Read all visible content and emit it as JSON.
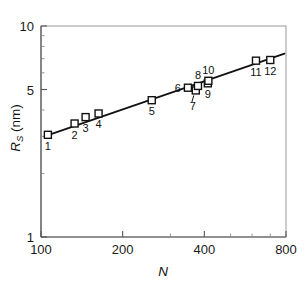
{
  "chart_data": {
    "type": "scatter",
    "title": "",
    "xlabel": "N",
    "ylabel": "R_S (nm)",
    "ylabel_main": "R",
    "ylabel_sub": "S",
    "ylabel_unit": " (nm)",
    "xscale": "log",
    "yscale": "log",
    "xlim": [
      100,
      800
    ],
    "ylim": [
      1,
      10
    ],
    "grid": false,
    "legend": "none",
    "xticks": [
      100,
      200,
      400,
      800
    ],
    "xtick_labels": [
      "100",
      "200",
      "400",
      "800"
    ],
    "xticks_minor": [
      300,
      500,
      600,
      700
    ],
    "yticks": [
      1,
      5,
      10
    ],
    "ytick_labels": [
      "1",
      "5",
      "10"
    ],
    "yticks_minor": [
      2,
      3,
      4,
      6,
      7,
      8,
      9
    ],
    "marker_style": "open-square",
    "line_color": "#111111",
    "marker_edge_color": "#111111",
    "marker_face_color": "#ffffff",
    "points": [
      {
        "label": "1",
        "x": 106,
        "y": 3.05,
        "label_pos": "below"
      },
      {
        "label": "2",
        "x": 133,
        "y": 3.45,
        "label_pos": "below"
      },
      {
        "label": "3",
        "x": 146,
        "y": 3.7,
        "label_pos": "below"
      },
      {
        "label": "4",
        "x": 163,
        "y": 3.85,
        "label_pos": "below"
      },
      {
        "label": "5",
        "x": 256,
        "y": 4.45,
        "label_pos": "below"
      },
      {
        "label": "6",
        "x": 348,
        "y": 5.1,
        "label_pos": "left"
      },
      {
        "label": "7",
        "x": 372,
        "y": 4.95,
        "label_pos": "below-leader"
      },
      {
        "label": "8",
        "x": 379,
        "y": 5.2,
        "label_pos": "above"
      },
      {
        "label": "9",
        "x": 412,
        "y": 5.35,
        "label_pos": "below"
      },
      {
        "label": "10",
        "x": 414,
        "y": 5.5,
        "label_pos": "above"
      },
      {
        "label": "11",
        "x": 620,
        "y": 6.85,
        "label_pos": "below"
      },
      {
        "label": "12",
        "x": 700,
        "y": 6.9,
        "label_pos": "below"
      }
    ],
    "fit_line": {
      "description": "power-law fit line through data",
      "x_start": 103,
      "y_start": 3.0,
      "x_end": 790,
      "y_end": 7.4
    }
  }
}
